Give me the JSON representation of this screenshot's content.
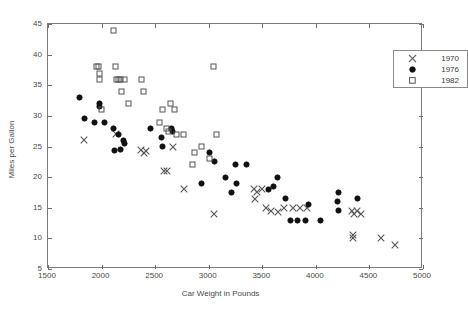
{
  "chart_data": {
    "type": "scatter",
    "title": "",
    "xlabel": "Car Weight in Pounds",
    "ylabel": "Miles per Gallon",
    "xlim": [
      1500,
      5000
    ],
    "ylim": [
      5,
      45
    ],
    "xticks": [
      1500,
      2000,
      2500,
      3000,
      3500,
      4000,
      4500,
      5000
    ],
    "yticks": [
      5,
      10,
      15,
      20,
      25,
      30,
      35,
      40,
      45
    ],
    "grid": false,
    "legend_position": "top-right",
    "series": [
      {
        "name": "1970",
        "marker": "x",
        "color": "#555555",
        "points": [
          [
            1835,
            26.0
          ],
          [
            2130,
            27.0
          ],
          [
            2372,
            24.5
          ],
          [
            2395,
            24.0
          ],
          [
            2410,
            24.3
          ],
          [
            2580,
            21.0
          ],
          [
            2615,
            21.0
          ],
          [
            2665,
            25.0
          ],
          [
            2770,
            18.0
          ],
          [
            3045,
            14.0
          ],
          [
            3420,
            18.0
          ],
          [
            3435,
            16.5
          ],
          [
            3450,
            17.5
          ],
          [
            3500,
            18.0
          ],
          [
            3530,
            15.0
          ],
          [
            3580,
            14.5
          ],
          [
            3645,
            14.3
          ],
          [
            3705,
            15.0
          ],
          [
            3790,
            15.0
          ],
          [
            3850,
            15.0
          ],
          [
            3920,
            15.0
          ],
          [
            4340,
            14.5
          ],
          [
            4360,
            14.0
          ],
          [
            4385,
            14.5
          ],
          [
            4420,
            14.0
          ],
          [
            4345,
            10.5
          ],
          [
            4350,
            10.0
          ],
          [
            4610,
            10.0
          ],
          [
            4735,
            9.0
          ]
        ]
      },
      {
        "name": "1976",
        "marker": "filled-circle",
        "color": "#111111",
        "points": [
          [
            1795,
            33.0
          ],
          [
            1840,
            29.5
          ],
          [
            1935,
            29.0
          ],
          [
            1980,
            32.0
          ],
          [
            1985,
            31.5
          ],
          [
            2025,
            29.0
          ],
          [
            2110,
            28.0
          ],
          [
            2125,
            24.3
          ],
          [
            2160,
            27.0
          ],
          [
            2180,
            24.5
          ],
          [
            2200,
            26.0
          ],
          [
            2215,
            25.5
          ],
          [
            2455,
            28.0
          ],
          [
            2560,
            26.5
          ],
          [
            2570,
            25.0
          ],
          [
            2650,
            28.0
          ],
          [
            2665,
            27.5
          ],
          [
            2930,
            19.0
          ],
          [
            3005,
            24.0
          ],
          [
            3055,
            22.5
          ],
          [
            3160,
            20.0
          ],
          [
            3210,
            17.5
          ],
          [
            3250,
            22.0
          ],
          [
            3255,
            19.0
          ],
          [
            3350,
            22.0
          ],
          [
            3560,
            18.0
          ],
          [
            3600,
            18.5
          ],
          [
            3645,
            20.0
          ],
          [
            3720,
            16.5
          ],
          [
            3765,
            13.0
          ],
          [
            3830,
            13.0
          ],
          [
            3900,
            13.0
          ],
          [
            3930,
            15.5
          ],
          [
            4040,
            13.0
          ],
          [
            4200,
            16.0
          ],
          [
            4210,
            17.5
          ],
          [
            4215,
            14.5
          ],
          [
            4385,
            16.5
          ]
        ]
      },
      {
        "name": "1982",
        "marker": "open-square",
        "color": "#555555",
        "points": [
          [
            1955,
            38.0
          ],
          [
            1975,
            38.0
          ],
          [
            1980,
            36.0
          ],
          [
            1985,
            37.0
          ],
          [
            2000,
            31.0
          ],
          [
            2115,
            44.0
          ],
          [
            2130,
            38.0
          ],
          [
            2135,
            36.0
          ],
          [
            2155,
            36.0
          ],
          [
            2175,
            36.0
          ],
          [
            2190,
            34.0
          ],
          [
            2215,
            36.0
          ],
          [
            2255,
            32.0
          ],
          [
            2375,
            36.0
          ],
          [
            2390,
            34.0
          ],
          [
            2545,
            29.0
          ],
          [
            2565,
            31.0
          ],
          [
            2610,
            28.0
          ],
          [
            2620,
            27.5
          ],
          [
            2640,
            32.0
          ],
          [
            2680,
            31.0
          ],
          [
            2700,
            27.0
          ],
          [
            2765,
            27.0
          ],
          [
            2850,
            22.0
          ],
          [
            2865,
            24.0
          ],
          [
            2935,
            25.0
          ],
          [
            3010,
            23.0
          ],
          [
            3045,
            38.0
          ],
          [
            3070,
            27.0
          ]
        ]
      }
    ]
  },
  "axis": {
    "x_title": "Car Weight in Pounds",
    "y_title": "Miles per Gallon",
    "x_ticks": [
      "1500",
      "2000",
      "2500",
      "3000",
      "3500",
      "4000",
      "4500",
      "5000"
    ],
    "y_ticks": [
      "45",
      "40",
      "35",
      "30",
      "25",
      "20",
      "15",
      "10",
      "5"
    ]
  },
  "legend": {
    "entries": [
      {
        "label": "1970",
        "marker": "x-marker-icon"
      },
      {
        "label": "1976",
        "marker": "filled-circle-icon"
      },
      {
        "label": "1982",
        "marker": "open-square-icon"
      }
    ]
  }
}
